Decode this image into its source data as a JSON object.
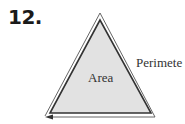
{
  "problem": {
    "number": "12."
  },
  "figure": {
    "shape": "triangle",
    "labels": {
      "area": "Area",
      "perimeter": "Perimete"
    },
    "colors": {
      "fill": "#e2e2e2",
      "inner_stroke": "#333333",
      "outer_stroke": "#555555",
      "text": "#333333"
    },
    "arrow_direction": "left"
  }
}
